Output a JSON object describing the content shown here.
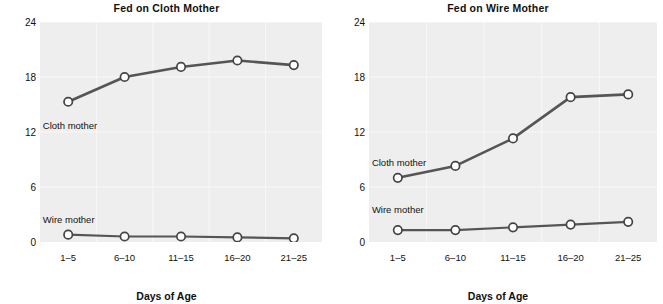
{
  "chart_data": [
    {
      "type": "line",
      "title": "Fed on Cloth Mother",
      "xlabel": "Days of Age",
      "ylabel": "Mean Hours per Day",
      "categories": [
        "1–5",
        "6–10",
        "11–15",
        "16–20",
        "21–25"
      ],
      "ylim": [
        0,
        24
      ],
      "yticks": [
        0,
        6,
        12,
        18,
        24
      ],
      "grid": true,
      "legend_position": "inline-annotation",
      "series": [
        {
          "name": "Cloth mother",
          "values": [
            15.3,
            18.0,
            19.1,
            19.8,
            19.3
          ]
        },
        {
          "name": "Wire mother",
          "values": [
            0.8,
            0.6,
            0.6,
            0.5,
            0.4
          ]
        }
      ],
      "annotations": [
        {
          "text": "Cloth mother",
          "x": 0.1,
          "y": 13.3
        },
        {
          "text": "Wire mother",
          "x": 0.1,
          "y": 3.1
        }
      ]
    },
    {
      "type": "line",
      "title": "Fed on Wire Mother",
      "xlabel": "Days of Age",
      "ylabel": "Mean Hours per Day",
      "categories": [
        "1–5",
        "6–10",
        "11–15",
        "16–20",
        "21–25"
      ],
      "ylim": [
        0,
        24
      ],
      "yticks": [
        0,
        6,
        12,
        18,
        24
      ],
      "grid": true,
      "legend_position": "inline-annotation",
      "series": [
        {
          "name": "Cloth mother",
          "values": [
            7.0,
            8.3,
            11.3,
            15.8,
            16.1
          ]
        },
        {
          "name": "Wire mother",
          "values": [
            1.3,
            1.3,
            1.6,
            1.9,
            2.2
          ]
        }
      ],
      "annotations": [
        {
          "text": "Cloth mother",
          "x": 0.1,
          "y": 9.3
        },
        {
          "text": "Wire mother",
          "x": 0.1,
          "y": 4.1
        }
      ]
    }
  ],
  "style": {
    "line_color": "#555555",
    "marker_fill": "#ffffff",
    "marker_stroke": "#444444",
    "plot_background": "#eeeeee",
    "grid_color": "#f8f8f8",
    "text_color": "#111111"
  }
}
